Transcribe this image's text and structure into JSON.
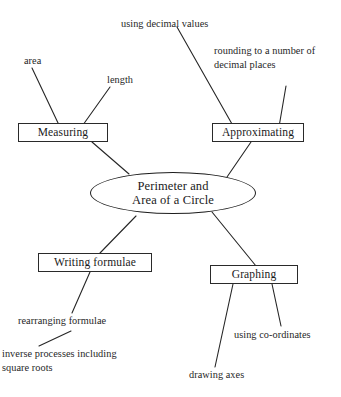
{
  "diagram": {
    "background_color": "#ffffff",
    "line_color": "#262626",
    "text_color": "#1f1f1f",
    "center": {
      "id": "center-node",
      "label": "Perimeter and\nArea of a Circle",
      "line1": "Perimeter and",
      "line2": "Area of a Circle",
      "shape": "ellipse"
    },
    "boxes": [
      {
        "id": "measuring",
        "label": "Measuring",
        "shape": "rectangle"
      },
      {
        "id": "approximating",
        "label": "Approximating",
        "shape": "rectangle"
      },
      {
        "id": "writing-formulae",
        "label": "Writing formulae",
        "shape": "rectangle"
      },
      {
        "id": "graphing",
        "label": "Graphing",
        "shape": "rectangle"
      }
    ],
    "leaves": [
      {
        "id": "area",
        "label": "area"
      },
      {
        "id": "length",
        "label": "length"
      },
      {
        "id": "using-decimal-values",
        "label": "using decimal values"
      },
      {
        "id": "rounding",
        "label": "rounding to a number  of\ndecimal places"
      },
      {
        "id": "rearranging-formulae",
        "label": "rearranging formulae"
      },
      {
        "id": "inverse-processes",
        "label": "inverse processes including\nsquare roots"
      },
      {
        "id": "using-co-ordinates",
        "label": "using co-ordinates"
      },
      {
        "id": "drawing-axes",
        "label": "drawing axes"
      }
    ],
    "connections": [
      {
        "from": "area",
        "to": "measuring"
      },
      {
        "from": "length",
        "to": "measuring"
      },
      {
        "from": "measuring",
        "to": "center"
      },
      {
        "from": "using-decimal-values",
        "to": "approximating"
      },
      {
        "from": "rounding",
        "to": "approximating"
      },
      {
        "from": "approximating",
        "to": "center"
      },
      {
        "from": "center",
        "to": "writing-formulae"
      },
      {
        "from": "center",
        "to": "graphing"
      },
      {
        "from": "writing-formulae",
        "to": "rearranging-formulae"
      },
      {
        "from": "rearranging-formulae",
        "to": "inverse-processes"
      },
      {
        "from": "graphing",
        "to": "drawing-axes"
      },
      {
        "from": "graphing",
        "to": "using-co-ordinates"
      }
    ]
  }
}
